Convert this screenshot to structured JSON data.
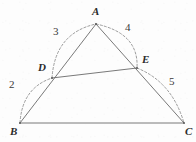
{
  "figure": {
    "type": "geometry-diagram",
    "background_color": "#fdfdfd",
    "solid_line_color": "#6a6a6a",
    "dashed_arc_color": "#8a8a8a",
    "label_color": "#2b2b2b"
  },
  "points": [
    {
      "name": "A",
      "label": "A",
      "x": 96,
      "y": 24,
      "label_x": 92,
      "label_y": 6
    },
    {
      "name": "B",
      "label": "B",
      "x": 20,
      "y": 123,
      "label_x": 10,
      "label_y": 126
    },
    {
      "name": "C",
      "label": "C",
      "x": 184,
      "y": 123,
      "label_x": 185,
      "label_y": 126
    },
    {
      "name": "D",
      "label": "D",
      "x": 52,
      "y": 78,
      "label_x": 38,
      "label_y": 62
    },
    {
      "name": "E",
      "label": "E",
      "x": 137,
      "y": 68,
      "label_x": 142,
      "label_y": 54
    }
  ],
  "segments": [
    {
      "name": "side-BC",
      "from": "B",
      "to": "C"
    },
    {
      "name": "side-BA",
      "from": "B",
      "to": "A"
    },
    {
      "name": "side-AC",
      "from": "A",
      "to": "C"
    },
    {
      "name": "segment-DE",
      "from": "D",
      "to": "E"
    }
  ],
  "arcs": [
    {
      "name": "arc-BD",
      "from": "B",
      "to": "D",
      "label": "2",
      "label_x": 9,
      "label_y": 79,
      "bulge": "outward-left"
    },
    {
      "name": "arc-DA",
      "from": "D",
      "to": "A",
      "label": "3",
      "label_x": 53,
      "label_y": 26,
      "bulge": "outward-left"
    },
    {
      "name": "arc-AE",
      "from": "A",
      "to": "E",
      "label": "4",
      "label_x": 125,
      "label_y": 22,
      "bulge": "outward-right"
    },
    {
      "name": "arc-EC",
      "from": "E",
      "to": "C",
      "label": "5",
      "label_x": 169,
      "label_y": 76,
      "bulge": "outward-right"
    }
  ]
}
